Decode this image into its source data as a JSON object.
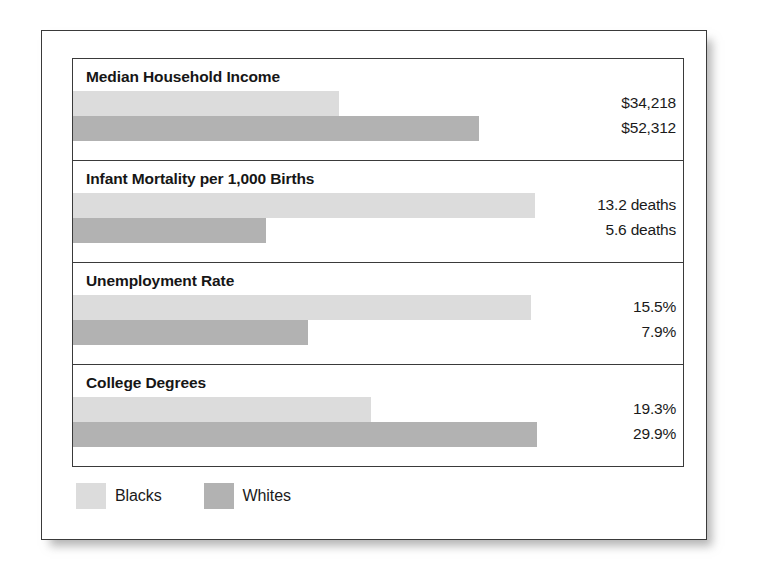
{
  "legend": {
    "entries": [
      {
        "label": "Blacks",
        "color": "#dcdcdc",
        "swatch_name": "legend-swatch-blacks"
      },
      {
        "label": "Whites",
        "color": "#b2b2b2",
        "swatch_name": "legend-swatch-whites"
      }
    ]
  },
  "sections": [
    {
      "title": "Median Household Income",
      "rows": [
        {
          "series": "Blacks",
          "value_label": "$34,218",
          "value": 34218,
          "bar_px": 266
        },
        {
          "series": "Whites",
          "value_label": "$52,312",
          "value": 52312,
          "bar_px": 406
        }
      ]
    },
    {
      "title": "Infant Mortality per 1,000 Births",
      "rows": [
        {
          "series": "Blacks",
          "value_label": "13.2 deaths",
          "value": 13.2,
          "bar_px": 462
        },
        {
          "series": "Whites",
          "value_label": "5.6 deaths",
          "value": 5.6,
          "bar_px": 193
        }
      ]
    },
    {
      "title": "Unemployment Rate",
      "rows": [
        {
          "series": "Blacks",
          "value_label": "15.5%",
          "value": 15.5,
          "bar_px": 458
        },
        {
          "series": "Whites",
          "value_label": "7.9%",
          "value": 7.9,
          "bar_px": 235
        }
      ]
    },
    {
      "title": "College Degrees",
      "rows": [
        {
          "series": "Blacks",
          "value_label": "19.3%",
          "value": 19.3,
          "bar_px": 298
        },
        {
          "series": "Whites",
          "value_label": "29.9%",
          "value": 29.9,
          "bar_px": 464
        }
      ]
    }
  ],
  "chart_data": {
    "type": "bar",
    "title": "",
    "orientation": "horizontal",
    "grid": false,
    "legend_position": "bottom-left",
    "categories": [
      "Median Household Income",
      "Infant Mortality per 1,000 Births",
      "Unemployment Rate",
      "College Degrees"
    ],
    "series": [
      {
        "name": "Blacks",
        "color": "#dcdcdc",
        "values": [
          34218,
          13.2,
          15.5,
          19.3
        ],
        "value_labels": [
          "$34,218",
          "13.2 deaths",
          "15.5%",
          "19.3%"
        ]
      },
      {
        "name": "Whites",
        "color": "#b2b2b2",
        "values": [
          52312,
          5.6,
          7.9,
          29.9
        ],
        "value_labels": [
          "$52,312",
          "5.6 deaths",
          "7.9%",
          "29.9%"
        ]
      }
    ],
    "units": [
      "US dollars",
      "deaths per 1,000 births",
      "percent",
      "percent"
    ],
    "xlabel": "",
    "ylabel": ""
  }
}
